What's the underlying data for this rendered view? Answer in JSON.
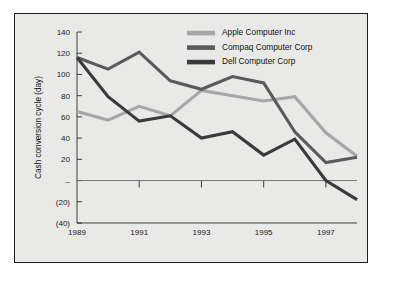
{
  "chart_data": {
    "type": "line",
    "title": "",
    "xlabel": "",
    "ylabel": "Cash conversion cycle (day)",
    "x": [
      1989,
      1990,
      1991,
      1992,
      1993,
      1994,
      1995,
      1996,
      1997,
      1998
    ],
    "xtick_labels": [
      "1989",
      "1991",
      "1993",
      "1995",
      "1997"
    ],
    "xtick_values": [
      1989,
      1991,
      1993,
      1995,
      1997
    ],
    "ytick_labels": [
      "140",
      "120",
      "100",
      "80",
      "60",
      "40",
      "20",
      "–",
      "(20)",
      "(40)"
    ],
    "ytick_values": [
      140,
      120,
      100,
      80,
      60,
      40,
      20,
      0,
      -20,
      -40
    ],
    "ylim": [
      -40,
      140
    ],
    "xlim": [
      1989,
      1998
    ],
    "grid": false,
    "legend_position": "top-right",
    "series": [
      {
        "name": "Apple Computer Inc",
        "color": "#a6a6a6",
        "values": [
          65,
          57,
          70,
          61,
          85,
          80,
          75,
          79,
          45,
          23
        ]
      },
      {
        "name": "Compaq Computer Corp",
        "color": "#5a5a5a",
        "values": [
          116,
          105,
          121,
          94,
          86,
          98,
          92,
          46,
          17,
          22
        ]
      },
      {
        "name": "Dell Computer Corp",
        "color": "#3a3a3a",
        "values": [
          116,
          79,
          56,
          61,
          40,
          46,
          24,
          39,
          0,
          -18
        ]
      }
    ]
  },
  "legend": {
    "items": [
      {
        "label": "Apple Computer Inc",
        "color": "#a6a6a6"
      },
      {
        "label": "Compaq Computer Corp",
        "color": "#5a5a5a"
      },
      {
        "label": "Dell Computer Corp",
        "color": "#3a3a3a"
      }
    ]
  },
  "axes": {
    "y_axis_title": "Cash conversion cycle (day)"
  },
  "colors": {
    "page_background": "#ffffff",
    "panel_background": "#e9e9e7",
    "border": "#1c1c1c",
    "axis": "#2a2a2a",
    "text": "#111111"
  }
}
